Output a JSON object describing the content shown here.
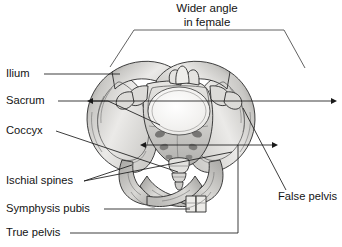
{
  "figure": {
    "type": "anatomical-diagram",
    "background_color": "#ffffff",
    "line_color": "#1a1a1a",
    "title": {
      "line1": "Wider angle",
      "line2": "in female"
    },
    "labels_left": [
      {
        "id": "ilium",
        "text": "Ilium",
        "x": 6,
        "y": 74
      },
      {
        "id": "sacrum",
        "text": "Sacrum",
        "x": 6,
        "y": 101
      },
      {
        "id": "coccyx",
        "text": "Coccyx",
        "x": 6,
        "y": 131
      },
      {
        "id": "ischial-spines",
        "text": "Ischial spines",
        "x": 6,
        "y": 181
      },
      {
        "id": "symphysis-pubis",
        "text": "Symphysis pubis",
        "x": 6,
        "y": 209
      },
      {
        "id": "true-pelvis",
        "text": "True pelvis",
        "x": 6,
        "y": 233
      }
    ],
    "labels_right": [
      {
        "id": "false-pelvis",
        "text": "False pelvis",
        "x": 278,
        "y": 197
      }
    ],
    "measurements": [
      {
        "id": "pelvic-inlet-transverse",
        "y": 101,
        "x1": 93,
        "x2": 331
      },
      {
        "id": "interspinous-distance",
        "y": 145,
        "x1": 146,
        "x2": 272
      }
    ],
    "bone_fill": {
      "light": "#f2f1ef",
      "mid": "#cfcecb",
      "shade": "#a9a8a5",
      "dark": "#7d7c7a"
    }
  }
}
